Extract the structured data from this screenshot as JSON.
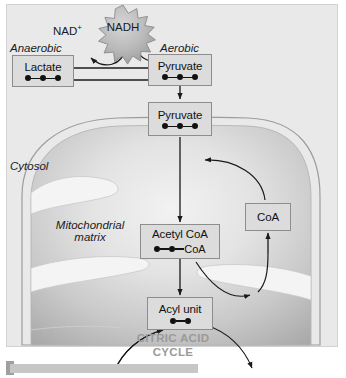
{
  "figure": {
    "background_color": "#e9e9e9",
    "box_fill_color": "#dcdcdc",
    "box_border_color": "#8d8d8d",
    "cycle_text_color": "#9a9a9a",
    "carbon_dot_color": "#111111"
  },
  "labels": {
    "anaerobic": "Anaerobic",
    "aerobic": "Aerobic",
    "cytosol": "Cytosol",
    "matrix_line1": "Mitochondrial",
    "matrix_line2": "matrix",
    "nad_plus": "NAD",
    "nad_plus_sup": "+",
    "nadh": "NADH",
    "citric_acid_line1": "CITRIC ACID",
    "citric_acid_line2": "CYCLE"
  },
  "boxes": [
    {
      "id": "lactate",
      "label": "Lactate",
      "carbons": 3,
      "suffix": ""
    },
    {
      "id": "pyruvate-cytosol",
      "label": "Pyruvate",
      "carbons": 3,
      "suffix": ""
    },
    {
      "id": "pyruvate-matrix",
      "label": "Pyruvate",
      "carbons": 3,
      "suffix": ""
    },
    {
      "id": "acetyl-coa",
      "label": "Acetyl CoA",
      "carbons": 2,
      "suffix": "CoA"
    },
    {
      "id": "acyl-unit",
      "label": "Acyl unit",
      "carbons": 2,
      "suffix": ""
    },
    {
      "id": "coa",
      "label": "CoA",
      "carbons": 0,
      "suffix": ""
    }
  ]
}
